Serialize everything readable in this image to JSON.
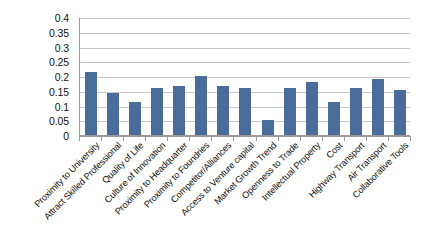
{
  "chart_data": {
    "type": "bar",
    "title": "",
    "subtitle": "",
    "xlabel": "",
    "ylabel": "",
    "ylim": [
      0,
      0.4
    ],
    "ytick_labels": [
      "0",
      "0.05",
      "0.1",
      "0.15",
      "0.2",
      "0.25",
      "0.3",
      "0.35",
      "0.4"
    ],
    "ytick_values": [
      0,
      0.05,
      0.1,
      0.15,
      0.2,
      0.25,
      0.3,
      0.35,
      0.4
    ],
    "grid": "horizontal",
    "legend": "none",
    "series_color": "#4a6c9b",
    "categories": [
      "Proximity to University",
      "Attract Skilled Professional",
      "Quality of Life",
      "Culture of Innovation",
      "Proximity to Headquarter",
      "Proximity to Foundries",
      "Competitor/Alliances",
      "Access to Venture capital",
      "Market Growth Trend",
      "Openness to Trade",
      "Intellectual Property",
      "Cost",
      "Highway Transport",
      "Air Transport",
      "Collaborative Tools"
    ],
    "values": [
      0.214,
      0.141,
      0.111,
      0.16,
      0.167,
      0.201,
      0.167,
      0.161,
      0.05,
      0.161,
      0.181,
      0.111,
      0.161,
      0.191,
      0.151
    ]
  }
}
